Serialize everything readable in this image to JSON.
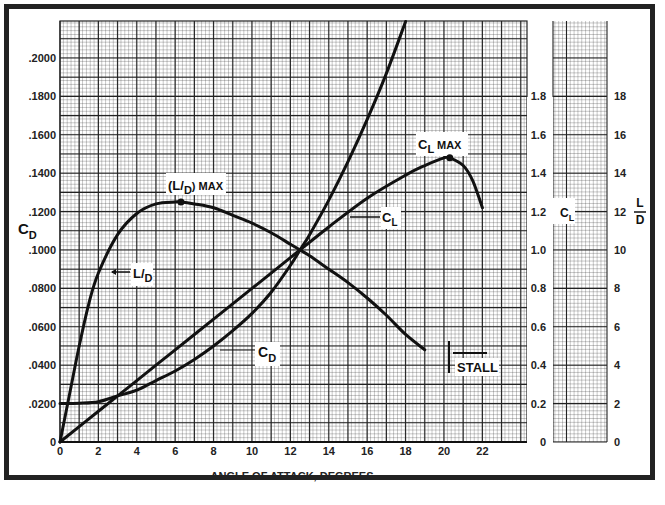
{
  "chart_data": {
    "type": "line",
    "title": "",
    "xlabel": "ANGLE OF ATTACK, DEGREES",
    "x_ticks": [
      "0",
      "2",
      "4",
      "6",
      "8",
      "10",
      "12",
      "14",
      "16",
      "18",
      "20",
      "22"
    ],
    "xlim": [
      0,
      24
    ],
    "axes": {
      "left": {
        "label": "C_D",
        "label_main": "C",
        "label_sub": "D",
        "ylim": [
          0,
          0.22
        ],
        "ticks": [
          "0",
          ".0200",
          ".0400",
          ".0600",
          ".0800",
          ".1000",
          ".1200",
          ".1400",
          ".1600",
          ".1800",
          ".2000"
        ]
      },
      "right_cl": {
        "label": "C_L",
        "label_main": "C",
        "label_sub": "L",
        "ylim": [
          0,
          2.2
        ],
        "ticks": [
          "0",
          "0.2",
          "0.4",
          "0.6",
          "0.8",
          "1.0",
          "1.2",
          "1.4",
          "1.6",
          "1.8"
        ]
      },
      "right_ld": {
        "label": "L/D",
        "label_num": "L",
        "label_den": "D",
        "ylim": [
          0,
          22
        ],
        "ticks": [
          "0",
          "2",
          "4",
          "6",
          "8",
          "10",
          "12",
          "14",
          "16",
          "18"
        ]
      }
    },
    "grid": true,
    "series": [
      {
        "name": "C_L",
        "axis": "right_cl",
        "x": [
          0,
          2,
          4,
          6,
          8,
          10,
          12,
          12.5,
          14,
          16,
          18,
          19,
          20,
          20.3,
          21,
          21.5,
          22
        ],
        "y": [
          0,
          0.16,
          0.32,
          0.48,
          0.64,
          0.8,
          0.96,
          1.0,
          1.12,
          1.27,
          1.39,
          1.44,
          1.48,
          1.48,
          1.44,
          1.36,
          1.22
        ]
      },
      {
        "name": "C_D",
        "axis": "left",
        "x": [
          0,
          1,
          2,
          3,
          4,
          5,
          6,
          7,
          8,
          9,
          10,
          11,
          12,
          12.5,
          13,
          14,
          15,
          16,
          17,
          18
        ],
        "y": [
          0.02,
          0.0202,
          0.021,
          0.024,
          0.027,
          0.032,
          0.037,
          0.043,
          0.05,
          0.058,
          0.067,
          0.078,
          0.092,
          0.1,
          0.108,
          0.126,
          0.146,
          0.168,
          0.192,
          0.219
        ]
      },
      {
        "name": "L/D",
        "axis": "right_ld",
        "x": [
          0,
          0.5,
          1,
          1.5,
          2,
          3,
          4,
          5,
          6,
          6.3,
          7,
          8,
          9,
          10,
          11,
          12,
          12.5,
          13,
          14,
          15,
          16,
          17,
          18,
          19
        ],
        "y": [
          0,
          2.5,
          5.0,
          7.2,
          8.8,
          10.8,
          11.9,
          12.4,
          12.5,
          12.5,
          12.4,
          12.2,
          11.8,
          11.4,
          10.9,
          10.3,
          10.0,
          9.7,
          9.0,
          8.3,
          7.5,
          6.6,
          5.6,
          4.8
        ]
      }
    ],
    "annotations": [
      {
        "text": "(L/D) MAX",
        "x": 6.3,
        "y_ld": 12.5
      },
      {
        "text": "C_L MAX",
        "x": 20.3,
        "y_cl": 1.48
      },
      {
        "text": "C_L",
        "pointer_to": "C_L curve"
      },
      {
        "text": "C_D",
        "pointer_to": "C_D curve"
      },
      {
        "text": "L/D",
        "pointer_to": "L/D curve"
      },
      {
        "text": "STALL",
        "x": 20
      }
    ]
  },
  "labels": {
    "xlabel": "ANGLE OF ATTACK, DEGREES",
    "cd_main": "C",
    "cd_sub": "D",
    "cl_main": "C",
    "cl_sub": "L",
    "ld_num": "L",
    "ld_den": "D",
    "ld_max_paren_l": "(L/",
    "ld_max_d": "D",
    "ld_max_tail": ") MAX",
    "clmax_c": "C",
    "clmax_l": "L",
    "clmax_tail": " MAX",
    "ld_curve_l": "L/",
    "ld_curve_d": "D",
    "stall": "STALL"
  }
}
